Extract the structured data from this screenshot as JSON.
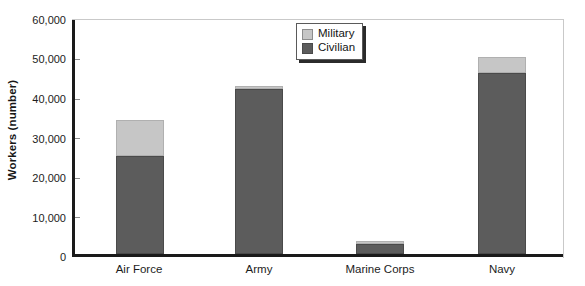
{
  "chart_data": {
    "type": "bar",
    "subtype": "stacked-vertical",
    "title": "",
    "xlabel": "",
    "ylabel": "Workers (number)",
    "ylim": [
      0,
      60000
    ],
    "ytick_values": [
      0,
      10000,
      20000,
      30000,
      40000,
      50000,
      60000
    ],
    "ytick_labels": [
      "0",
      "10,000",
      "20,000",
      "30,000",
      "40,000",
      "50,000",
      "60,000"
    ],
    "grid": false,
    "legend_position": "top-center-right",
    "categories": [
      "Air Force",
      "Army",
      "Marine Corps",
      "Navy"
    ],
    "series": [
      {
        "name": "Civilian",
        "color": "#5c5c5c",
        "values": [
          25200,
          42200,
          2500,
          46500
        ]
      },
      {
        "name": "Military",
        "color": "#c6c6c6",
        "values": [
          9100,
          800,
          800,
          4000
        ]
      }
    ],
    "totals": [
      34300,
      43000,
      3300,
      50500
    ]
  },
  "axis": {
    "y_title": "Workers (number)",
    "ticks": [
      {
        "label": "60,000",
        "value": 60000
      },
      {
        "label": "50,000",
        "value": 50000
      },
      {
        "label": "40,000",
        "value": 40000
      },
      {
        "label": "30,000",
        "value": 30000
      },
      {
        "label": "20,000",
        "value": 20000
      },
      {
        "label": "10,000",
        "value": 10000
      },
      {
        "label": "0",
        "value": 0
      }
    ],
    "categories": [
      {
        "label": "Air Force"
      },
      {
        "label": "Army"
      },
      {
        "label": "Marine Corps"
      },
      {
        "label": "Navy"
      }
    ]
  },
  "legend": {
    "items": [
      {
        "label": "Military",
        "color": "#c6c6c6"
      },
      {
        "label": "Civilian",
        "color": "#5c5c5c"
      }
    ]
  },
  "colors": {
    "military": "#c6c6c6",
    "civilian": "#5c5c5c",
    "axis": "#1a1a1a",
    "background": "#ffffff"
  }
}
